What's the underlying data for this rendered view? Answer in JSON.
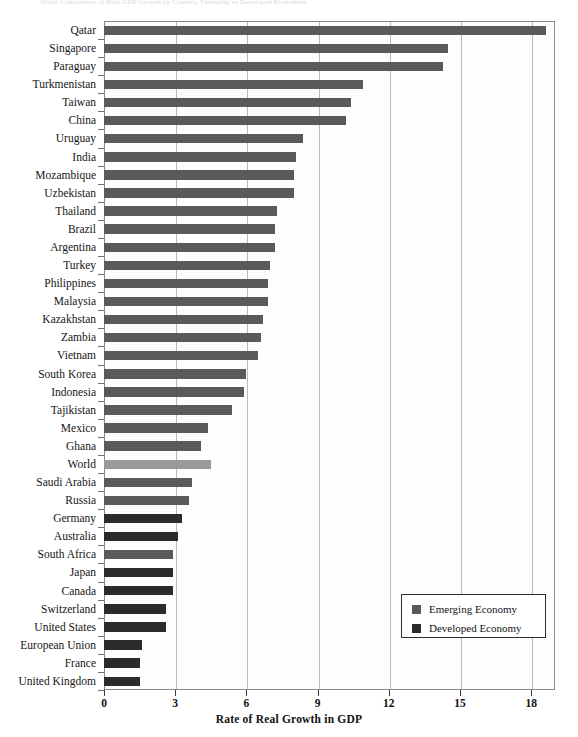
{
  "top_caption": "World Comparison of Real GDP Growth by Country, Emerging vs Developed Economies",
  "legend": {
    "items": [
      {
        "label": "Emerging Economy",
        "color": "#5a5a5a",
        "key": "emerging"
      },
      {
        "label": "Developed Economy",
        "color": "#2b2b2b",
        "key": "developed"
      }
    ]
  },
  "chart_data": {
    "type": "bar",
    "orientation": "horizontal",
    "title": "",
    "xlabel": "Rate of Real Growth in GDP",
    "ylabel": "",
    "xlim": [
      0,
      19.0
    ],
    "xticks": [
      0,
      3,
      6,
      9,
      12,
      15,
      18
    ],
    "xtick_labels": [
      "0",
      "3",
      "6",
      "9",
      "12",
      "15",
      "18"
    ],
    "grid": true,
    "grid_axis": "x",
    "legend_position": "bottom-right",
    "colors": {
      "emerging": "#5a5a5a",
      "developed": "#2b2b2b",
      "world": "#9a9a9a"
    },
    "categories": [
      "Qatar",
      "Singapore",
      "Paraguay",
      "Turkmenistan",
      "Taiwan",
      "China",
      "Uruguay",
      "India",
      "Mozambique",
      "Uzbekistan",
      "Thailand",
      "Brazil",
      "Argentina",
      "Turkey",
      "Philippines",
      "Malaysia",
      "Kazakhstan",
      "Zambia",
      "Vietnam",
      "South Korea",
      "Indonesia",
      "Tajikistan",
      "Mexico",
      "Ghana",
      "World",
      "Saudi Arabia",
      "Russia",
      "Germany",
      "Australia",
      "South Africa",
      "Japan",
      "Canada",
      "Switzerland",
      "United States",
      "European Union",
      "France",
      "United Kingdom"
    ],
    "values": [
      18.6,
      14.5,
      14.3,
      10.9,
      10.4,
      10.2,
      8.4,
      8.1,
      8.0,
      8.0,
      7.3,
      7.2,
      7.2,
      7.0,
      6.9,
      6.9,
      6.7,
      6.6,
      6.5,
      6.0,
      5.9,
      5.4,
      4.4,
      4.1,
      4.5,
      3.7,
      3.6,
      3.3,
      3.1,
      2.9,
      2.9,
      2.9,
      2.6,
      2.6,
      1.6,
      1.5,
      1.5
    ],
    "groups": [
      "emerging",
      "emerging",
      "emerging",
      "emerging",
      "emerging",
      "emerging",
      "emerging",
      "emerging",
      "emerging",
      "emerging",
      "emerging",
      "emerging",
      "emerging",
      "emerging",
      "emerging",
      "emerging",
      "emerging",
      "emerging",
      "emerging",
      "emerging",
      "emerging",
      "emerging",
      "emerging",
      "emerging",
      "world",
      "emerging",
      "emerging",
      "developed",
      "developed",
      "emerging",
      "developed",
      "developed",
      "developed",
      "developed",
      "developed",
      "developed",
      "developed"
    ]
  }
}
